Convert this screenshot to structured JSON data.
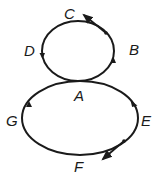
{
  "diagram": {
    "type": "figure-eight path with tangent arrows",
    "stroke_color": "#1a1a1a",
    "background": "#ffffff",
    "labels": {
      "A": "A",
      "B": "B",
      "C": "C",
      "D": "D",
      "E": "E",
      "F": "F",
      "G": "G"
    },
    "top_loop": {
      "direction": "counterclockwise",
      "points": [
        "A",
        "B",
        "C",
        "D"
      ],
      "tangent_arrow_at": "C"
    },
    "bottom_loop": {
      "direction": "clockwise",
      "points": [
        "A",
        "E",
        "F",
        "G"
      ],
      "tangent_arrow_at": "F"
    }
  }
}
